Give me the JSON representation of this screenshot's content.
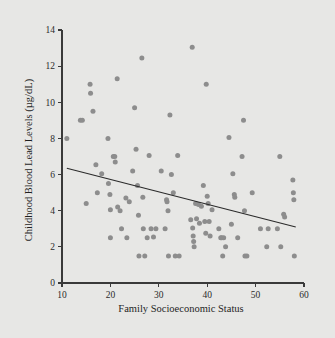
{
  "figure": {
    "background_color": "#e7e7e5",
    "point_color": "#8d8d8d",
    "line_color": "#2a2a2a",
    "axis_color": "#3a3a3a"
  },
  "axis_titles": {
    "x": "Family Socioeconomic Status",
    "y": "Childhood Blood Lead Levels (µg/dL)"
  },
  "ticks": {
    "x": [
      "10",
      "20",
      "30",
      "40",
      "50",
      "60"
    ],
    "y": [
      "0",
      "2",
      "4",
      "6",
      "8",
      "10",
      "12",
      "14"
    ]
  },
  "chart_data": {
    "type": "scatter",
    "title": "",
    "xlabel": "Family Socioeconomic Status",
    "ylabel": "Childhood Blood Lead Levels (µg/dL)",
    "xlim": [
      10,
      60
    ],
    "ylim": [
      0,
      14
    ],
    "xticks": [
      10,
      20,
      30,
      40,
      50,
      60
    ],
    "yticks": [
      0,
      2,
      4,
      6,
      8,
      10,
      12,
      14
    ],
    "grid": false,
    "legend": null,
    "marker": "circle",
    "marker_color": "#8d8d8d",
    "series": [
      {
        "name": "Children",
        "points": [
          [
            11.0,
            8.0
          ],
          [
            13.8,
            9.0
          ],
          [
            14.2,
            9.0
          ],
          [
            15.0,
            4.4
          ],
          [
            15.8,
            11.0
          ],
          [
            15.9,
            10.5
          ],
          [
            16.4,
            9.5
          ],
          [
            17.0,
            6.55
          ],
          [
            17.3,
            5.0
          ],
          [
            18.2,
            6.05
          ],
          [
            19.5,
            8.0
          ],
          [
            19.6,
            5.5
          ],
          [
            19.9,
            4.9
          ],
          [
            20.0,
            4.05
          ],
          [
            20.0,
            2.5
          ],
          [
            20.6,
            7.0
          ],
          [
            20.9,
            7.0
          ],
          [
            21.0,
            6.7
          ],
          [
            21.4,
            11.3
          ],
          [
            21.5,
            4.2
          ],
          [
            22.0,
            4.0
          ],
          [
            22.3,
            3.0
          ],
          [
            23.2,
            4.7
          ],
          [
            23.4,
            2.5
          ],
          [
            23.9,
            4.5
          ],
          [
            24.6,
            6.2
          ],
          [
            25.0,
            9.7
          ],
          [
            25.3,
            7.4
          ],
          [
            25.6,
            5.4
          ],
          [
            25.8,
            3.75
          ],
          [
            25.9,
            1.5
          ],
          [
            26.5,
            12.45
          ],
          [
            26.7,
            4.75
          ],
          [
            26.8,
            3.0
          ],
          [
            27.1,
            1.5
          ],
          [
            27.6,
            2.5
          ],
          [
            28.0,
            7.05
          ],
          [
            28.4,
            3.0
          ],
          [
            28.9,
            2.55
          ],
          [
            29.4,
            3.0
          ],
          [
            30.5,
            6.2
          ],
          [
            31.3,
            3.0
          ],
          [
            31.6,
            4.6
          ],
          [
            31.7,
            4.5
          ],
          [
            31.9,
            4.0
          ],
          [
            32.0,
            1.5
          ],
          [
            32.3,
            9.3
          ],
          [
            32.6,
            6.0
          ],
          [
            33.0,
            5.0
          ],
          [
            33.4,
            1.5
          ],
          [
            33.9,
            7.05
          ],
          [
            34.2,
            1.5
          ],
          [
            36.6,
            3.5
          ],
          [
            36.9,
            13.05
          ],
          [
            37.0,
            3.05
          ],
          [
            37.1,
            2.6
          ],
          [
            37.2,
            2.3
          ],
          [
            37.3,
            2.0
          ],
          [
            37.6,
            4.4
          ],
          [
            37.8,
            3.55
          ],
          [
            38.2,
            4.35
          ],
          [
            38.4,
            3.3
          ],
          [
            38.8,
            4.25
          ],
          [
            39.2,
            5.4
          ],
          [
            39.5,
            3.4
          ],
          [
            39.7,
            2.75
          ],
          [
            39.8,
            11.0
          ],
          [
            40.0,
            4.8
          ],
          [
            40.2,
            4.4
          ],
          [
            40.4,
            3.4
          ],
          [
            40.6,
            2.6
          ],
          [
            41.0,
            4.05
          ],
          [
            42.4,
            3.0
          ],
          [
            42.8,
            2.5
          ],
          [
            43.0,
            2.5
          ],
          [
            43.2,
            1.5
          ],
          [
            43.4,
            2.5
          ],
          [
            43.8,
            2.0
          ],
          [
            44.5,
            8.05
          ],
          [
            45.0,
            3.25
          ],
          [
            45.3,
            6.05
          ],
          [
            45.6,
            4.9
          ],
          [
            45.7,
            4.75
          ],
          [
            46.3,
            2.5
          ],
          [
            47.2,
            7.0
          ],
          [
            47.5,
            9.0
          ],
          [
            47.7,
            4.0
          ],
          [
            47.8,
            1.5
          ],
          [
            48.2,
            1.5
          ],
          [
            49.3,
            5.0
          ],
          [
            51.0,
            3.0
          ],
          [
            52.3,
            2.0
          ],
          [
            52.6,
            3.0
          ],
          [
            54.5,
            3.0
          ],
          [
            55.0,
            7.0
          ],
          [
            55.2,
            2.0
          ],
          [
            55.8,
            3.8
          ],
          [
            56.0,
            3.65
          ],
          [
            57.7,
            5.7
          ],
          [
            57.8,
            5.0
          ],
          [
            57.9,
            4.6
          ],
          [
            58.0,
            1.5
          ]
        ]
      }
    ],
    "trend_line": {
      "type": "linear-fit",
      "x_start": 11.0,
      "y_start": 6.35,
      "x_end": 58.3,
      "y_end": 3.1
    }
  }
}
